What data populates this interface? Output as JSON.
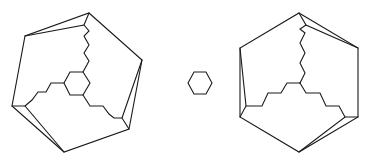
{
  "diagram": {
    "stroke_color": "#1a1a1a",
    "background": "#ffffff",
    "figures": [
      {
        "id": "left-cage",
        "outer_polygon": [
          [
            89,
            13
          ],
          [
            142,
            60
          ],
          [
            129,
            129
          ],
          [
            64,
            152
          ],
          [
            12,
            106
          ],
          [
            25,
            36
          ]
        ],
        "inner_vertices": [
          [
            84,
            25
          ],
          [
            122,
            118
          ],
          [
            25,
            106
          ]
        ],
        "core": "hexagon",
        "core_hexagon": [
          [
            64,
            83
          ],
          [
            70,
            72
          ],
          [
            83,
            72
          ],
          [
            90,
            83
          ],
          [
            83,
            95
          ],
          [
            70,
            95
          ]
        ],
        "chains": [
          [
            [
              83,
              72
            ],
            [
              89,
              61
            ],
            [
              84,
              53
            ],
            [
              89,
              45
            ],
            [
              84,
              36
            ],
            [
              89,
              31
            ],
            [
              84,
              25
            ]
          ],
          [
            [
              64,
              83
            ],
            [
              51,
              83
            ],
            [
              46,
              92
            ],
            [
              38,
              92
            ],
            [
              32,
              100
            ],
            [
              25,
              106
            ]
          ],
          [
            [
              83,
              95
            ],
            [
              90,
              106
            ],
            [
              103,
              106
            ],
            [
              109,
              114
            ],
            [
              114,
              118
            ],
            [
              122,
              118
            ]
          ]
        ]
      },
      {
        "id": "free-hexagon",
        "polygon": [
          [
            188,
            83
          ],
          [
            194,
            72
          ],
          [
            206,
            72
          ],
          [
            212,
            83
          ],
          [
            206,
            94
          ],
          [
            194,
            94
          ]
        ]
      },
      {
        "id": "right-cage",
        "outer_polygon": [
          [
            299,
            13
          ],
          [
            358,
            48
          ],
          [
            358,
            117
          ],
          [
            299,
            152
          ],
          [
            240,
            117
          ],
          [
            240,
            48
          ]
        ],
        "inner_vertices": [
          [
            306,
            25
          ],
          [
            345,
            117
          ],
          [
            246,
            106
          ]
        ],
        "core": "point",
        "junction": [
          300,
          83
        ],
        "chains": [
          [
            [
              300,
              83
            ],
            [
              305,
              73
            ],
            [
              300,
              63
            ],
            [
              305,
              53
            ],
            [
              300,
              43
            ],
            [
              305,
              33
            ],
            [
              300,
              29
            ],
            [
              306,
              25
            ]
          ],
          [
            [
              300,
              83
            ],
            [
              287,
              83
            ],
            [
              281,
              93
            ],
            [
              268,
              93
            ],
            [
              262,
              106
            ],
            [
              246,
              106
            ]
          ],
          [
            [
              300,
              83
            ],
            [
              306,
              93
            ],
            [
              320,
              93
            ],
            [
              326,
              106
            ],
            [
              339,
              106
            ],
            [
              345,
              117
            ]
          ]
        ]
      }
    ]
  }
}
